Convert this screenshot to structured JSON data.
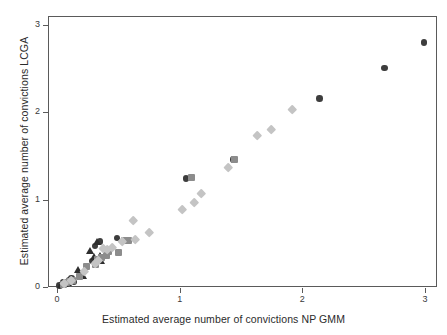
{
  "chart_data": {
    "type": "scatter",
    "title": "",
    "xlabel": "Estimated average number of convictions NP GMM",
    "ylabel": "Estimated average number of convictions LCGA",
    "xlim": [
      0,
      3.17
    ],
    "ylim": [
      0,
      3.1
    ],
    "xticks": [
      0,
      1,
      2,
      3
    ],
    "yticks": [
      0,
      1,
      2,
      3
    ],
    "xticklabels": [
      "0",
      "1",
      "2",
      "3"
    ],
    "yticklabels": [
      "0",
      "1",
      "2",
      "3"
    ],
    "grid": false,
    "legend": "none",
    "series": [
      {
        "name": "group-1-circles",
        "marker": "circle",
        "color": "#3d3d3d",
        "points": [
          [
            0.02,
            0.02
          ],
          [
            0.04,
            0.03
          ],
          [
            0.05,
            0.05
          ],
          [
            0.07,
            0.06
          ],
          [
            0.08,
            0.04
          ],
          [
            0.1,
            0.08
          ],
          [
            0.12,
            0.1
          ],
          [
            0.14,
            0.06
          ],
          [
            0.29,
            0.3
          ],
          [
            0.31,
            0.47
          ],
          [
            0.35,
            0.52
          ],
          [
            0.49,
            0.56
          ],
          [
            1.05,
            1.24
          ],
          [
            1.09,
            1.25
          ],
          [
            1.44,
            1.46
          ],
          [
            2.14,
            2.16
          ],
          [
            2.67,
            2.51
          ],
          [
            2.99,
            2.8
          ]
        ]
      },
      {
        "name": "group-2-triangles",
        "marker": "triangle",
        "color": "#2e2e2e",
        "points": [
          [
            0.03,
            0.02
          ],
          [
            0.06,
            0.04
          ],
          [
            0.09,
            0.05
          ],
          [
            0.11,
            0.07
          ],
          [
            0.17,
            0.19
          ],
          [
            0.21,
            0.13
          ],
          [
            0.27,
            0.41
          ],
          [
            0.3,
            0.34
          ],
          [
            0.33,
            0.52
          ],
          [
            0.35,
            0.36
          ],
          [
            0.36,
            0.3
          ]
        ]
      },
      {
        "name": "group-3-squares",
        "marker": "square",
        "color": "#8c8c8c",
        "points": [
          [
            0.05,
            0.03
          ],
          [
            0.08,
            0.05
          ],
          [
            0.1,
            0.06
          ],
          [
            0.13,
            0.07
          ],
          [
            0.18,
            0.12
          ],
          [
            0.24,
            0.24
          ],
          [
            0.31,
            0.26
          ],
          [
            0.33,
            0.32
          ],
          [
            0.36,
            0.34
          ],
          [
            0.4,
            0.36
          ],
          [
            0.42,
            0.41
          ],
          [
            0.5,
            0.4
          ],
          [
            0.55,
            0.53
          ],
          [
            0.58,
            0.53
          ],
          [
            1.1,
            1.25
          ],
          [
            1.45,
            1.46
          ]
        ]
      },
      {
        "name": "group-4-diamonds",
        "marker": "diamond",
        "color": "#c4c4c4",
        "points": [
          [
            0.06,
            0.04
          ],
          [
            0.12,
            0.08
          ],
          [
            0.22,
            0.18
          ],
          [
            0.31,
            0.27
          ],
          [
            0.34,
            0.31
          ],
          [
            0.38,
            0.44
          ],
          [
            0.41,
            0.43
          ],
          [
            0.45,
            0.46
          ],
          [
            0.53,
            0.52
          ],
          [
            0.62,
            0.76
          ],
          [
            0.64,
            0.55
          ],
          [
            0.75,
            0.63
          ],
          [
            1.02,
            0.89
          ],
          [
            1.12,
            0.97
          ],
          [
            1.18,
            1.07
          ],
          [
            1.4,
            1.37
          ],
          [
            1.63,
            1.74
          ],
          [
            1.75,
            1.81
          ],
          [
            1.92,
            2.03
          ]
        ]
      }
    ]
  },
  "axes": {
    "x_tick_labels": [
      "0",
      "1",
      "2",
      "3"
    ],
    "y_tick_labels": [
      "0",
      "1",
      "2",
      "3"
    ],
    "x_title": "Estimated average number of convictions NP GMM",
    "y_title": "Estimated average number of convictions LCGA"
  },
  "colors": {
    "circle": "#3d3d3d",
    "triangle": "#2e2e2e",
    "square": "#8c8c8c",
    "diamond": "#c4c4c4",
    "frame": "#5a5a5a",
    "text": "#2b2b2b",
    "background": "#ffffff"
  }
}
